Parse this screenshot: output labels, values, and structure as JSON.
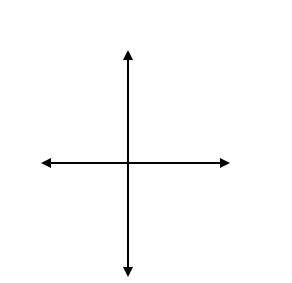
{
  "chart_data": {
    "type": "line",
    "title": "",
    "xlabel": "x",
    "ylabel": "y",
    "x_scale_label": "(scl = 2)",
    "y_scale_label": "(scl = 2)",
    "xlim": [
      -10,
      10
    ],
    "ylim": [
      -10,
      10
    ],
    "grid": true,
    "grid_style": "dotted",
    "scale": 2,
    "series": [
      {
        "name": "boundary-1",
        "style": "dashed",
        "points": [
          [
            -10,
            26
          ],
          [
            10,
            -22
          ]
        ],
        "description": "steep decreasing line through approx (0,2) and (1.3,0)"
      },
      {
        "name": "boundary-2",
        "style": "dashed",
        "points": [
          [
            -8,
            -11
          ],
          [
            10,
            6
          ]
        ],
        "description": "increasing line through approx (0,-4) and (4,0)"
      },
      {
        "name": "boundary-3",
        "style": "dashed",
        "points": [
          [
            -2.2,
            14
          ],
          [
            0,
            8
          ],
          [
            1.8,
            14
          ]
        ],
        "description": "absolute-value V with vertex near (0,8)"
      }
    ],
    "shaded_region": "above boundary-2, right of boundary-1, outside the V of boundary-3",
    "shade_color": "#555555"
  },
  "labels": {
    "y_axis": "y",
    "y_scale": "(scl = 2)",
    "x_axis": "x",
    "x_scale": "(scl = 2)"
  }
}
